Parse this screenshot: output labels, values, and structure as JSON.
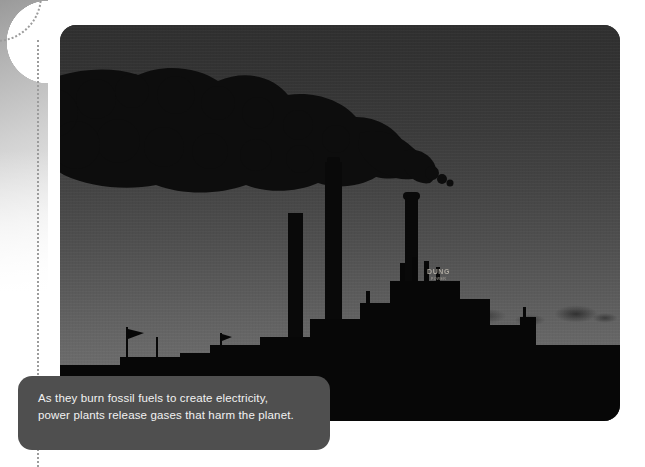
{
  "page": {
    "background_color": "#ffffff",
    "width": 645,
    "height": 467
  },
  "decoration": {
    "corner_gradient_name": "gray-gradient-corner",
    "gradient_start_color": "#9a9a9a",
    "gradient_end_color": "#ffffff",
    "dotted_line_color": "#9c9c9c"
  },
  "photo": {
    "alt": "Silhouette of a coal power plant with three smokestacks releasing a large dark smoke plume against a gray dusk sky",
    "sky_top_color": "#2f2f2f",
    "sky_bottom_color": "#737373",
    "silhouette_color": "#090909",
    "smoke_color": "#101010",
    "building_sign": {
      "line1": "DUNG",
      "line2": "POWER"
    }
  },
  "caption": {
    "background_color": "#4f4f4f",
    "text_color": "#f2f2f2",
    "line1": "As they burn fossil fuels to create electricity,",
    "line2": "power plants release gases that harm the planet."
  }
}
